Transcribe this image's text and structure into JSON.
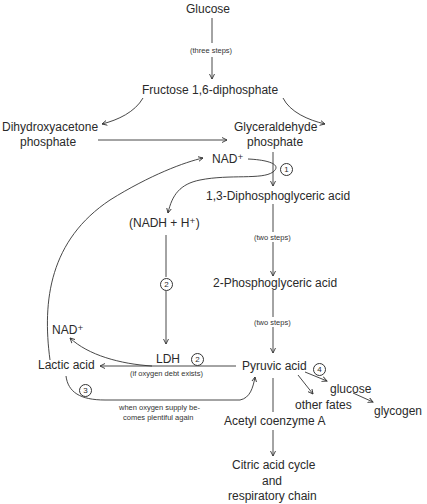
{
  "diagram": {
    "nodes": {
      "glucose": "Glucose",
      "three_steps": "(three steps)",
      "fructose": "Fructose 1,6-diphosphate",
      "dhap_line1": "Dihydroxyacetone",
      "dhap_line2": "phosphate",
      "gap_line1": "Glyceraldehyde",
      "gap_line2": "phosphate",
      "nad_top": "NAD⁺",
      "dpg13": "1,3-Diphosphoglyceric acid",
      "nadh": "(NADH + H⁺)",
      "two_steps_1": "(two steps)",
      "pg2": "2-Phosphoglyceric acid",
      "two_steps_2": "(two steps)",
      "nad_left": "NAD⁺",
      "lactic": "Lactic acid",
      "ldh": "LDH",
      "oxygen_debt": "(if oxygen debt exists)",
      "pyruvic": "Pyruvic acid",
      "glucose2": "glucose",
      "other_fates": "other fates",
      "glycogen": "glycogen",
      "oxygen_supply_line1": "when oxygen supply be-",
      "oxygen_supply_line2": "comes plentiful again",
      "acetyl": "Acetyl coenzyme A",
      "citric_line1": "Citric acid cycle",
      "citric_line2": "and",
      "citric_line3": "respiratory chain"
    },
    "step_markers": {
      "m1": "1",
      "m2a": "2",
      "m2b": "2",
      "m3": "3",
      "m4": "4"
    }
  }
}
